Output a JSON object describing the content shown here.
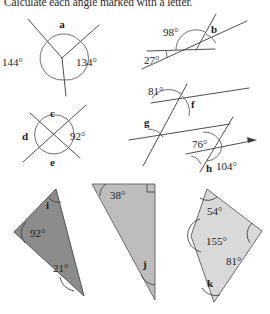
{
  "title": "Calculate each angle marked with a letter.",
  "worksheet": {
    "heading": "Calculate each angle marked with a letter.",
    "topic": "angles",
    "problems": [
      {
        "id": "a",
        "kind": "angles-around-a-point",
        "letter_label": "a",
        "given_angles": [
          "144°",
          "134°"
        ],
        "unknown_label": "a"
      },
      {
        "id": "b",
        "kind": "angles-on-a-straight-line",
        "letter_label": "b",
        "given_angles": [
          "98°",
          "27°"
        ],
        "unknown_label": "b"
      },
      {
        "id": "cde",
        "kind": "vertically-opposite-angles",
        "letter_labels": [
          "c",
          "d",
          "e"
        ],
        "given_angles": [
          "92°"
        ],
        "unknown_labels": [
          "c",
          "d",
          "e"
        ]
      },
      {
        "id": "fgh",
        "kind": "parallel-lines-transversal",
        "letter_labels": [
          "f",
          "g",
          "h"
        ],
        "given_angles": [
          "81°",
          "76°",
          "104°"
        ],
        "unknown_labels": [
          "f",
          "g",
          "h"
        ]
      },
      {
        "id": "i",
        "kind": "triangle-angle-sum",
        "letter_label": "i",
        "given_angles": [
          "92°",
          "21°"
        ],
        "unknown_label": "i",
        "fill": "#8c8c8c"
      },
      {
        "id": "j",
        "kind": "right-triangle-angle-sum",
        "letter_label": "j",
        "given_angles": [
          "38°"
        ],
        "right_angle": true,
        "unknown_label": "j",
        "fill": "#bdbdbd"
      },
      {
        "id": "k",
        "kind": "quadrilateral-angle-sum",
        "letter_label": "k",
        "given_angles": [
          "54°",
          "155°",
          "81°"
        ],
        "unknown_label": "k",
        "fill": "#d9d9d9"
      }
    ]
  },
  "fig_a": {
    "angle_left": "144°",
    "angle_right": "134°",
    "unknown": "a"
  },
  "fig_b": {
    "angle_top": "98°",
    "angle_bottom": "27°",
    "unknown": "b"
  },
  "fig_cde": {
    "top": "c",
    "left": "d",
    "right": "92°",
    "bottom": "e"
  },
  "fig_fgh": {
    "angle_f_given": "81°",
    "unknown_f": "f",
    "unknown_g": "g",
    "angle_h_given": "76°",
    "unknown_h": "h",
    "angle_exterior": "104°"
  },
  "fig_i": {
    "angle_1": "92°",
    "angle_2": "21°",
    "unknown": "i"
  },
  "fig_j": {
    "angle_1": "38°",
    "unknown": "j"
  },
  "fig_k": {
    "angle_1": "54°",
    "angle_2": "155°",
    "angle_3": "81°",
    "unknown": "k"
  },
  "colors": {
    "ink": "#2b2b2b",
    "line": "#3a3a3a",
    "fill_i": "#8c8c8c",
    "fill_j": "#bdbdbd",
    "fill_k": "#d9d9d9",
    "page": "#ffffff"
  }
}
